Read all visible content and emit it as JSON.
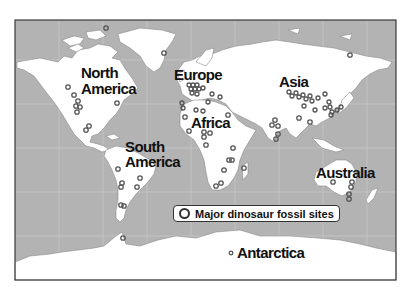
{
  "map": {
    "title": "",
    "continents": [
      {
        "id": "north-america",
        "label_line1": "North",
        "label_line2": "America"
      },
      {
        "id": "europe",
        "label": "Europe"
      },
      {
        "id": "asia",
        "label": "Asia"
      },
      {
        "id": "africa",
        "label": "Africa"
      },
      {
        "id": "south-america",
        "label_line1": "South",
        "label_line2": "America"
      },
      {
        "id": "australia",
        "label": "Australia"
      },
      {
        "id": "antarctica",
        "label": "Antarctica"
      }
    ],
    "legend": {
      "icon": "open-circle-marker",
      "label": "Major dinosaur fossil sites"
    },
    "colors": {
      "ocean": "#b3b3b3",
      "land": "#ffffff",
      "marker": "#555555",
      "frame": "#3a3a3a"
    }
  }
}
